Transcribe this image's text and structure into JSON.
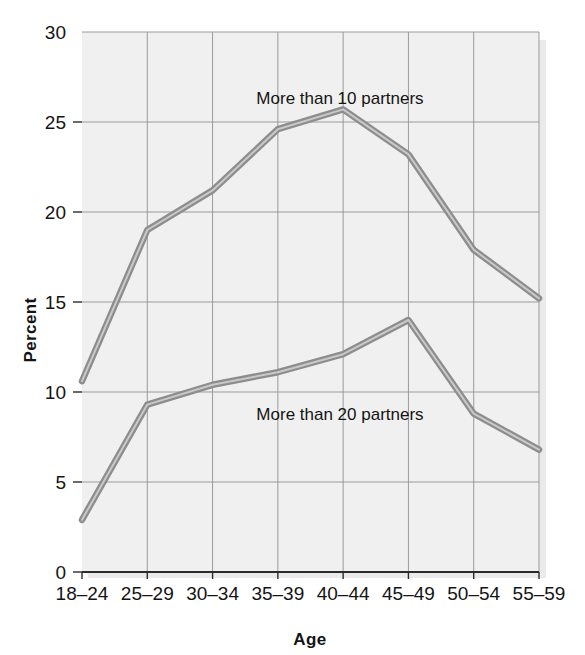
{
  "chart_data": {
    "type": "line",
    "title": "",
    "subtitle": "",
    "xlabel": "Age",
    "ylabel": "Percent",
    "categories": [
      "18–24",
      "25–29",
      "30–34",
      "35–39",
      "40–44",
      "45–49",
      "50–54",
      "55–59"
    ],
    "ylim": [
      0,
      30
    ],
    "yticks": [
      0,
      5,
      10,
      15,
      20,
      25,
      30
    ],
    "ytick_labels": [
      "0",
      "5",
      "10",
      "15",
      "20",
      "25",
      "30"
    ],
    "grid": true,
    "legend_position": "inline-annotations",
    "series": [
      {
        "name": "More than 10 partners",
        "values": [
          10.6,
          19.0,
          21.2,
          24.6,
          25.7,
          23.2,
          17.9,
          15.2
        ]
      },
      {
        "name": "More than 20 partners",
        "values": [
          2.9,
          9.3,
          10.4,
          11.1,
          12.1,
          14.0,
          8.8,
          6.8
        ]
      }
    ],
    "annotations": [
      {
        "text": "More than 10 partners",
        "series": "More than 10 partners"
      },
      {
        "text": "More than 20 partners",
        "series": "More than 20 partners"
      }
    ],
    "colors": {
      "line": "#8d8d8d",
      "line_highlight": "#c9c9c9",
      "plot_background": "#f0f0f0",
      "grid": "#9a9a9a",
      "axis": "#2b2b2b",
      "text": "#141414"
    }
  }
}
